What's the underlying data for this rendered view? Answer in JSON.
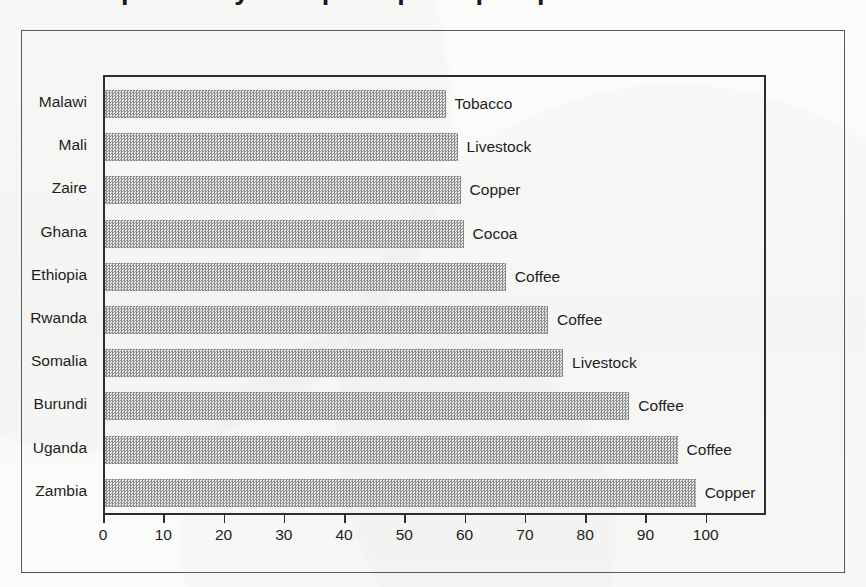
{
  "figure": {
    "cropped_title": "Dependency on a principal export product",
    "frame_color": "#55585c",
    "plot_border_color": "#2b2d30",
    "bar_fill_color": "#a0a0a0",
    "background_color": "#fbfbfa",
    "text_color": "#1c1e22"
  },
  "chart_data": {
    "type": "bar",
    "orientation": "horizontal",
    "title": "Dependency on a principal export product",
    "xlabel": "",
    "ylabel": "",
    "xlim": [
      0,
      110
    ],
    "xticks": [
      0,
      10,
      20,
      30,
      40,
      50,
      60,
      70,
      80,
      90,
      100
    ],
    "xtick_labels": [
      "0",
      "10",
      "20",
      "30",
      "40",
      "50",
      "60",
      "70",
      "80",
      "90",
      "100"
    ],
    "grid": false,
    "legend": false,
    "categories": [
      "Malawi",
      "Mali",
      "Zaire",
      "Ghana",
      "Ethiopia",
      "Rwanda",
      "Somalia",
      "Burundi",
      "Uganda",
      "Zambia"
    ],
    "values": [
      56.5,
      58.5,
      59,
      59.5,
      66.5,
      73.5,
      76,
      87,
      95,
      98
    ],
    "point_labels": [
      "Tobacco",
      "Livestock",
      "Copper",
      "Cocoa",
      "Coffee",
      "Coffee",
      "Livestock",
      "Coffee",
      "Coffee",
      "Copper"
    ]
  }
}
